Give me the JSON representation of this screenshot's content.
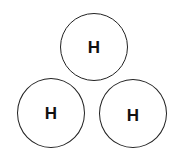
{
  "diagram": {
    "atoms": [
      {
        "label": "H",
        "position": "top"
      },
      {
        "label": "H",
        "position": "bottom-left"
      },
      {
        "label": "H",
        "position": "bottom-right"
      }
    ]
  },
  "colors": {
    "stroke": "#222222",
    "text": "#111111",
    "background": "#ffffff"
  }
}
